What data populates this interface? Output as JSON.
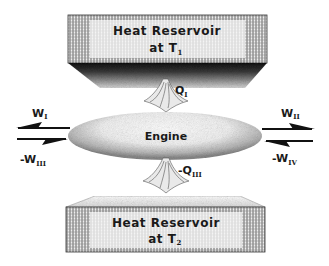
{
  "diagram": {
    "hot_reservoir": {
      "line1": "Heat Reservoir",
      "line2_prefix": "at T",
      "line2_sub": "1"
    },
    "cold_reservoir": {
      "line1": "Heat Reservoir",
      "line2_prefix": "at T",
      "line2_sub": "2"
    },
    "engine": {
      "label": "Engine"
    },
    "heat_in": {
      "prefix": "Q",
      "sub": "I"
    },
    "heat_out": {
      "prefix": "-Q",
      "sub": "III"
    },
    "work_left_out": {
      "prefix": "W",
      "sub": "I"
    },
    "work_left_in": {
      "prefix": "-W",
      "sub": "III"
    },
    "work_right_out": {
      "prefix": "W",
      "sub": "II"
    },
    "work_right_in": {
      "prefix": "-W",
      "sub": "IV"
    }
  }
}
